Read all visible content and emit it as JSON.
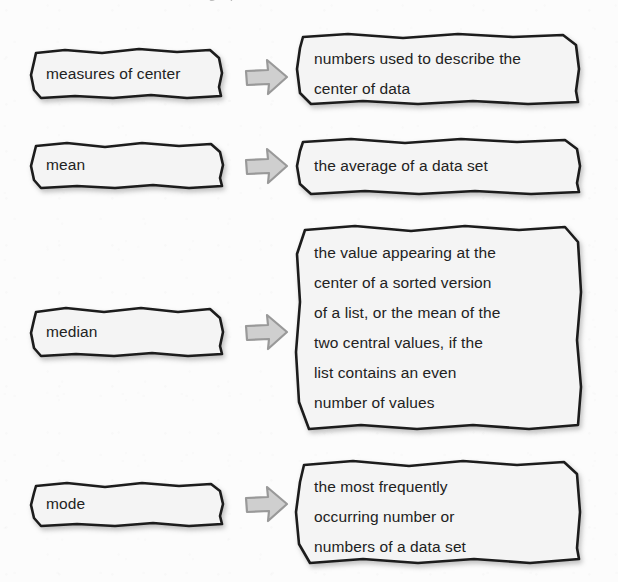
{
  "page": {
    "kind": "vocabulary-definition-diagram",
    "topic": "measures of center",
    "partial_top_line": "measures of center, and the graph",
    "background_color": "#fcfcfc",
    "box_fill_color": "#f4f4f4",
    "box_border_color": "#1c1c1c",
    "text_color": "#222222",
    "arrow_fill_color": "#cfcfcf",
    "arrow_border_color": "#9a9a9a"
  },
  "rows": [
    {
      "term": "measures of center",
      "arrow_icon": "right-block-arrow-icon",
      "definition": "numbers used to describe the\ncenter of data"
    },
    {
      "term": "mean",
      "arrow_icon": "right-block-arrow-icon",
      "definition": "the average of a data set"
    },
    {
      "term": "median",
      "arrow_icon": "right-block-arrow-icon",
      "definition": "the value appearing at the\ncenter of a sorted version\nof a list, or the mean of the\ntwo central values, if the\nlist contains an even\nnumber of values"
    },
    {
      "term": "mode",
      "arrow_icon": "right-block-arrow-icon",
      "definition": "the most frequently\noccurring number or\nnumbers of a data set"
    }
  ]
}
